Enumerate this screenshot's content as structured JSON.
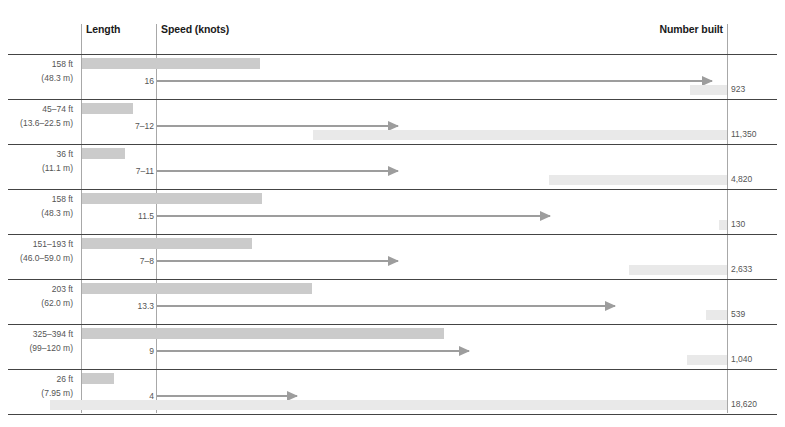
{
  "headers": {
    "length": "Length",
    "speed": "Speed (knots)",
    "number_built": "Number built"
  },
  "chart_data": {
    "type": "bar",
    "title": "",
    "subtitle": "",
    "xlabel": "",
    "ylabel": "",
    "grid": false,
    "legend_position": "none",
    "columns": [
      "Length",
      "Speed (knots)",
      "Number built"
    ],
    "categories": [
      "row-1",
      "row-2",
      "row-3",
      "row-4",
      "row-5",
      "row-6",
      "row-7",
      "row-8"
    ],
    "series": [
      {
        "name": "Length",
        "values": [
          48.3,
          22.5,
          11.1,
          48.3,
          59.0,
          62.0,
          120.0,
          7.95
        ],
        "unit": "m"
      },
      {
        "name": "Speed (knots)",
        "values": [
          16,
          12,
          11,
          11.5,
          8,
          13.3,
          9,
          4
        ],
        "unit": "knots"
      },
      {
        "name": "Number built",
        "values": [
          923,
          11350,
          4820,
          130,
          2633,
          539,
          1040,
          18620
        ],
        "unit": "count"
      }
    ],
    "rows": [
      {
        "length_ft": "158 ft",
        "length_m": "(48.3 m)",
        "speed": "16",
        "number_built": "923",
        "length_bar_px": 178,
        "speed_arrow_px": 555,
        "number_bar_left_px": 690
      },
      {
        "length_ft": "45–74 ft",
        "length_m": "(13.6–22.5 m)",
        "speed": "7–12",
        "number_built": "11,350",
        "length_bar_px": 51,
        "speed_arrow_px": 241,
        "number_bar_left_px": 313
      },
      {
        "length_ft": "36 ft",
        "length_m": "(11.1 m)",
        "speed": "7–11",
        "number_built": "4,820",
        "length_bar_px": 43,
        "speed_arrow_px": 241,
        "number_bar_left_px": 549
      },
      {
        "length_ft": "158 ft",
        "length_m": "(48.3 m)",
        "speed": "11.5",
        "number_built": "130",
        "length_bar_px": 180,
        "speed_arrow_px": 393,
        "number_bar_left_px": 719
      },
      {
        "length_ft": "151–193 ft",
        "length_m": "(46.0–59.0 m)",
        "speed": "7–8",
        "number_built": "2,633",
        "length_bar_px": 170,
        "speed_arrow_px": 241,
        "number_bar_left_px": 629
      },
      {
        "length_ft": "203 ft",
        "length_m": "(62.0 m)",
        "speed": "13.3",
        "number_built": "539",
        "length_bar_px": 230,
        "speed_arrow_px": 458,
        "number_bar_left_px": 706
      },
      {
        "length_ft": "325–394 ft",
        "length_m": "(99–120 m)",
        "speed": "9",
        "number_built": "1,040",
        "length_bar_px": 362,
        "speed_arrow_px": 312,
        "number_bar_left_px": 687
      },
      {
        "length_ft": "26 ft",
        "length_m": "(7.95 m)",
        "speed": "4",
        "number_built": "18,620",
        "length_bar_px": 32,
        "speed_arrow_px": 140,
        "number_bar_left_px": 50
      }
    ]
  }
}
